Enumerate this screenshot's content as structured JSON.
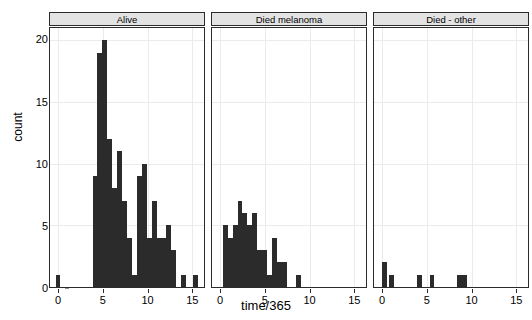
{
  "chart_data": {
    "type": "bar",
    "title": "",
    "xlabel": "time/365",
    "ylabel": "count",
    "xlim": [
      -0.9,
      16.3
    ],
    "ylim": [
      0,
      21
    ],
    "xticks": [
      0,
      5,
      10,
      15
    ],
    "yticks": [
      0,
      5,
      10,
      15,
      20
    ],
    "grid": true,
    "legend": "none",
    "binwidth": 0.55,
    "facets": [
      {
        "label": "Alive",
        "bins": [
          {
            "x": -0.28,
            "count": 1
          },
          {
            "x": 3.85,
            "count": 9
          },
          {
            "x": 4.4,
            "count": 19
          },
          {
            "x": 4.95,
            "count": 20
          },
          {
            "x": 5.5,
            "count": 12
          },
          {
            "x": 6.05,
            "count": 8
          },
          {
            "x": 6.6,
            "count": 11
          },
          {
            "x": 7.15,
            "count": 7
          },
          {
            "x": 7.7,
            "count": 4
          },
          {
            "x": 8.25,
            "count": 1
          },
          {
            "x": 8.8,
            "count": 9
          },
          {
            "x": 9.35,
            "count": 10
          },
          {
            "x": 9.9,
            "count": 4
          },
          {
            "x": 10.45,
            "count": 7
          },
          {
            "x": 11.0,
            "count": 4
          },
          {
            "x": 11.55,
            "count": 4
          },
          {
            "x": 12.1,
            "count": 5
          },
          {
            "x": 12.65,
            "count": 3
          },
          {
            "x": 13.7,
            "count": 1
          },
          {
            "x": 15.1,
            "count": 1
          }
        ]
      },
      {
        "label": "Died melanoma",
        "bins": [
          {
            "x": 0.3,
            "count": 5
          },
          {
            "x": 0.85,
            "count": 4
          },
          {
            "x": 1.4,
            "count": 5
          },
          {
            "x": 1.95,
            "count": 7
          },
          {
            "x": 2.5,
            "count": 6
          },
          {
            "x": 3.05,
            "count": 5
          },
          {
            "x": 3.6,
            "count": 6
          },
          {
            "x": 4.15,
            "count": 3
          },
          {
            "x": 4.7,
            "count": 3
          },
          {
            "x": 5.25,
            "count": 1
          },
          {
            "x": 5.8,
            "count": 4
          },
          {
            "x": 6.35,
            "count": 2
          },
          {
            "x": 6.9,
            "count": 2
          },
          {
            "x": 8.5,
            "count": 1
          }
        ]
      },
      {
        "label": "Died - other",
        "bins": [
          {
            "x": 0.0,
            "count": 2
          },
          {
            "x": 0.8,
            "count": 1
          },
          {
            "x": 3.9,
            "count": 1
          },
          {
            "x": 5.3,
            "count": 1
          },
          {
            "x": 8.4,
            "count": 1
          },
          {
            "x": 8.95,
            "count": 1
          }
        ]
      }
    ],
    "colors": {
      "bar": "#2b2b2b",
      "panel_background": "#ffffff",
      "grid": "#ebebeb",
      "strip_background": "#e3e3e3",
      "axis": "#2b2b2b",
      "text": "#000000"
    }
  },
  "axis": {
    "y_label": "count",
    "x_label": "time/365",
    "y_tick_labels": [
      "0",
      "5",
      "10",
      "15",
      "20"
    ],
    "x_tick_labels": [
      "0",
      "5",
      "10",
      "15"
    ]
  },
  "strips": {
    "alive": "Alive",
    "died_melanoma": "Died melanoma",
    "died_other": "Died - other"
  }
}
